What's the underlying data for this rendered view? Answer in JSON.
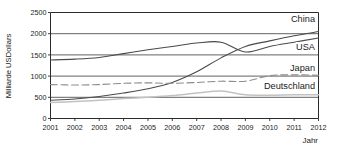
{
  "chart_data": {
    "type": "line",
    "title": "",
    "xlabel": "Jahr",
    "ylabel": "Milliarde USDollars",
    "x": [
      2001,
      2002,
      2003,
      2004,
      2005,
      2006,
      2007,
      2008,
      2009,
      2010,
      2011,
      2012
    ],
    "x_tick_labels": [
      "2001",
      "2002",
      "2003",
      "2004",
      "2005",
      "2006",
      "2007",
      "2008",
      "2009",
      "2010",
      "2011",
      "2012"
    ],
    "y_tick_labels": [
      "0",
      "500",
      "1000",
      "1500",
      "2000",
      "2500"
    ],
    "y_ticks": [
      0,
      500,
      1000,
      1500,
      2000,
      2500
    ],
    "ylim": [
      0,
      2500
    ],
    "xlim": [
      2001,
      2012
    ],
    "grid": "horizontal",
    "legend_position": "inline-right",
    "series": [
      {
        "name": "China",
        "color": "#4a4a4a",
        "style": "solid",
        "label": "China",
        "values": [
          430,
          460,
          520,
          600,
          700,
          850,
          1100,
          1430,
          1700,
          1830,
          1950,
          2050
        ]
      },
      {
        "name": "USA",
        "color": "#4a4a4a",
        "style": "solid",
        "label": "USA",
        "values": [
          1380,
          1400,
          1440,
          1530,
          1620,
          1700,
          1780,
          1800,
          1570,
          1700,
          1800,
          1900
        ]
      },
      {
        "name": "Japan",
        "color": "#8c8c8c",
        "style": "dashed",
        "label": "Japan",
        "values": [
          800,
          790,
          800,
          830,
          840,
          830,
          850,
          880,
          880,
          1010,
          1030,
          1020
        ]
      },
      {
        "name": "Deutschland",
        "color": "#c2c2c2",
        "style": "solid",
        "label": "Deutschland",
        "values": [
          380,
          400,
          430,
          470,
          500,
          540,
          600,
          650,
          560,
          550,
          560,
          560
        ]
      }
    ]
  },
  "axes": {
    "y_axis_title": "Milliarde USDollars",
    "x_axis_title": "Jahr"
  }
}
